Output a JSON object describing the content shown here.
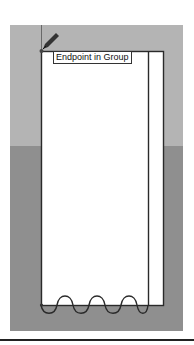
{
  "tooltip": {
    "text": "Endpoint in Group"
  },
  "colors": {
    "sky": "#b4b4b4",
    "ground": "#8f8f8f",
    "face": "#ffffff",
    "edge": "#2a2a2a",
    "tooltip_border": "#333333"
  },
  "cursor": {
    "icon": "pencil-icon"
  }
}
